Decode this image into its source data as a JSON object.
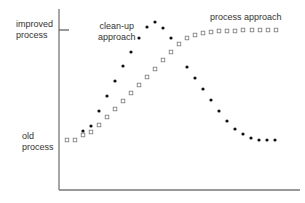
{
  "chart_data": {
    "type": "scatter",
    "title": "",
    "xlabel": "",
    "ylabel": "",
    "grid": false,
    "legend": "inline annotations",
    "y_tick_labels": {
      "top": [
        "improved",
        "process"
      ],
      "bottom": [
        "old",
        "process"
      ]
    },
    "axis_color": "#777777",
    "series": [
      {
        "name": "clean-up approach",
        "marker": "filled-dot",
        "color": "#111111",
        "label_lines": [
          "clean-up",
          "approach"
        ],
        "points": [
          [
            83,
            131
          ],
          [
            91,
            126
          ],
          [
            99,
            111
          ],
          [
            107,
            96
          ],
          [
            115,
            81
          ],
          [
            123,
            66
          ],
          [
            131,
            52
          ],
          [
            139,
            38
          ],
          [
            147,
            27
          ],
          [
            155,
            22
          ],
          [
            163,
            28
          ],
          [
            171,
            38
          ],
          [
            187,
            67
          ],
          [
            195,
            78
          ],
          [
            203,
            89
          ],
          [
            211,
            100
          ],
          [
            219,
            111
          ],
          [
            227,
            121
          ],
          [
            235,
            129
          ],
          [
            243,
            134
          ],
          [
            251,
            138
          ],
          [
            259,
            140
          ],
          [
            267,
            140
          ],
          [
            275,
            140
          ]
        ]
      },
      {
        "name": "process approach",
        "marker": "hollow-square",
        "color": "#777777",
        "label_lines": [
          "process approach"
        ],
        "points": [
          [
            67,
            140
          ],
          [
            75,
            140
          ],
          [
            83,
            135
          ],
          [
            91,
            132
          ],
          [
            99,
            125
          ],
          [
            107,
            117
          ],
          [
            115,
            109
          ],
          [
            123,
            101
          ],
          [
            131,
            93
          ],
          [
            139,
            85
          ],
          [
            147,
            77
          ],
          [
            155,
            69
          ],
          [
            163,
            60
          ],
          [
            171,
            52
          ],
          [
            179,
            44
          ],
          [
            187,
            38
          ],
          [
            195,
            35
          ],
          [
            203,
            33
          ],
          [
            211,
            32
          ],
          [
            219,
            31
          ],
          [
            227,
            31
          ],
          [
            235,
            31
          ],
          [
            243,
            30
          ],
          [
            252,
            30
          ],
          [
            260,
            30
          ],
          [
            268,
            30
          ],
          [
            276,
            30
          ]
        ]
      }
    ],
    "note": "points are [x_px, y_px] in screenshot coords; lower y = higher (improved) value"
  },
  "labels": {
    "improved_1": "improved",
    "improved_2": "process",
    "old_1": "old",
    "old_2": "process",
    "cleanup_1": "clean-up",
    "cleanup_2": "approach",
    "process_approach": "process approach"
  }
}
